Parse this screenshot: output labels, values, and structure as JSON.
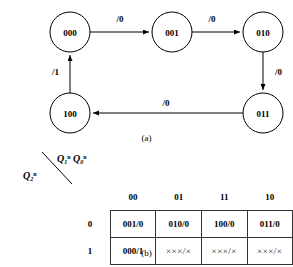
{
  "figure": {
    "caption_a": "(a)",
    "caption_b": "(b)"
  },
  "state_diagram": {
    "nodes": [
      {
        "id": "s000",
        "label": "000",
        "cx": 70,
        "cy": 32
      },
      {
        "id": "s001",
        "label": "001",
        "cx": 172,
        "cy": 32
      },
      {
        "id": "s010",
        "label": "010",
        "cx": 263,
        "cy": 32
      },
      {
        "id": "s011",
        "label": "011",
        "cx": 263,
        "cy": 113
      },
      {
        "id": "s100",
        "label": "100",
        "cx": 70,
        "cy": 113
      }
    ],
    "edges": [
      {
        "from": "000",
        "to": "001",
        "label": "/0",
        "lx": 120,
        "ly": 21
      },
      {
        "from": "001",
        "to": "010",
        "label": "/0",
        "lx": 212,
        "ly": 21
      },
      {
        "from": "010",
        "to": "011",
        "label": "/0",
        "lx": 274,
        "ly": 73
      },
      {
        "from": "011",
        "to": "100",
        "label": "/0",
        "lx": 165,
        "ly": 105
      },
      {
        "from": "100",
        "to": "000",
        "label": "/1",
        "lx": 58,
        "ly": 73
      }
    ]
  },
  "state_table": {
    "column_axis_label": {
      "var1": "Q",
      "sub1": "1",
      "sup1": "n",
      "var2": "Q",
      "sub2": "0",
      "sup2": "n"
    },
    "row_axis_label": {
      "var": "Q",
      "sub": "2",
      "sup": "n"
    },
    "column_headers": [
      "00",
      "01",
      "11",
      "10"
    ],
    "row_headers": [
      "0",
      "1"
    ],
    "rows": [
      [
        "001/0",
        "010/0",
        "100/0",
        "011/0"
      ],
      [
        "000/1",
        "×××/×",
        "×××/×",
        "×××/×"
      ]
    ]
  },
  "colors": {
    "stroke": "#000000",
    "table_border": "#333333",
    "background": "#ffffff"
  }
}
